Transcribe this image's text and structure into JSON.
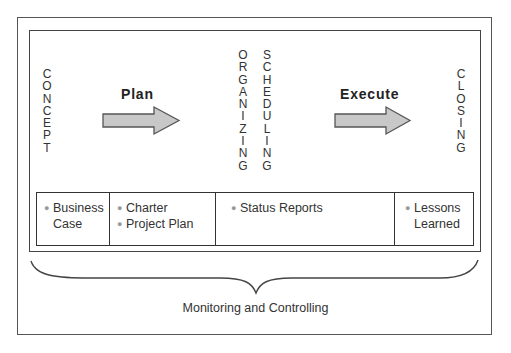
{
  "diagram": {
    "phases": {
      "start": "CONCEPT",
      "middle": [
        "ORGANIZING",
        "SCHEDULING"
      ],
      "end": "CLOSING"
    },
    "arrows": [
      {
        "label": "Plan",
        "fill": "#c8c8c8"
      },
      {
        "label": "Execute",
        "fill": "#c8c8c8"
      }
    ],
    "deliverables": [
      {
        "items": [
          "Business Case"
        ],
        "lines": [
          [
            "Business",
            "Case"
          ]
        ]
      },
      {
        "items": [
          "Charter",
          "Project Plan"
        ]
      },
      {
        "items": [
          "Status Reports"
        ]
      },
      {
        "items": [
          "Lessons Learned"
        ],
        "lines": [
          [
            "Lessons",
            "Learned"
          ]
        ]
      }
    ],
    "bracket_caption": "Monitoring and Controlling"
  }
}
